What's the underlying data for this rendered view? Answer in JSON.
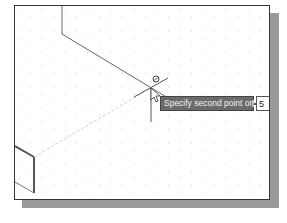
{
  "viewport": {
    "grid": "isometric-dot-grid",
    "colors": {
      "background": "#ffffff",
      "border": "#333333",
      "shadow": "#9a9a9a",
      "grid_dot": "#c8c8c8",
      "line": "#555555",
      "rubber_band": "#cfcfcf"
    }
  },
  "cursor": {
    "icon": "crosshair-cursor-icon",
    "snap_marker": "snap-circle-icon",
    "arrow": "arrow-pointer-icon"
  },
  "tooltip": {
    "prompt": "Specify second point or",
    "options_icon": "down-arrow-options-icon",
    "background": "#6b6b6b"
  },
  "dynamic_input": {
    "value": "5"
  }
}
